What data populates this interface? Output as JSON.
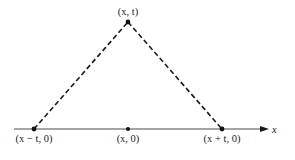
{
  "diagram": {
    "type": "characteristic-triangle",
    "colors": {
      "line": "#1a1a1a",
      "axis": "#4a4a4a",
      "background": "#ffffff"
    },
    "axis": {
      "label": "x",
      "x1": 14,
      "x2": 268,
      "y": 129
    },
    "points": {
      "apex": {
        "label": "(x, t)",
        "cx": 128,
        "cy": 22
      },
      "left": {
        "label": "(x − t, 0)",
        "cx": 34,
        "cy": 129
      },
      "center": {
        "label": "(x, 0)",
        "cx": 128,
        "cy": 129
      },
      "right": {
        "label": "(x + t, 0)",
        "cx": 222,
        "cy": 129
      }
    },
    "edges": [
      {
        "from": "left",
        "to": "apex",
        "style": "dashed"
      },
      {
        "from": "apex",
        "to": "right",
        "style": "dashed"
      }
    ]
  }
}
